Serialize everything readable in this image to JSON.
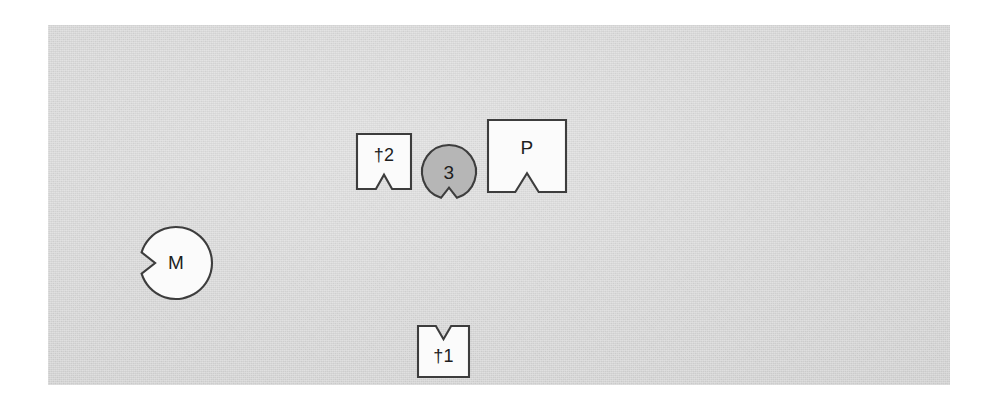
{
  "figure": {
    "background_color": "#ffffff",
    "canvas": {
      "name": "gray-scan-plate",
      "fill_color": "#d7d7d7",
      "x": 48,
      "y": 25,
      "width": 902,
      "height": 360
    },
    "outline_color": "#3d3d3d",
    "label_color": "#1e1e1e"
  },
  "shapes": [
    {
      "id": "shape-dagger2",
      "label": "†2",
      "form": "square",
      "fill_color": "#fbfbfb",
      "notch": "bottom",
      "x": 309,
      "y": 109,
      "width": 54,
      "height": 55
    },
    {
      "id": "shape-three",
      "label": "3",
      "form": "circle",
      "fill_color": "#b6b6b6",
      "notch": "bottom",
      "cx": 401,
      "cy": 147,
      "radius": 27
    },
    {
      "id": "shape-p",
      "label": "P",
      "form": "square",
      "fill_color": "#fbfbfb",
      "notch": "bottom",
      "x": 440,
      "y": 95,
      "width": 78,
      "height": 72
    },
    {
      "id": "shape-m",
      "label": "M",
      "form": "circle",
      "fill_color": "#fbfbfb",
      "notch": "left",
      "cx": 128,
      "cy": 238,
      "radius": 36
    },
    {
      "id": "shape-dagger1",
      "label": "†1",
      "form": "square",
      "fill_color": "#fbfbfb",
      "notch": "top",
      "x": 370,
      "y": 301,
      "width": 51,
      "height": 51
    }
  ]
}
